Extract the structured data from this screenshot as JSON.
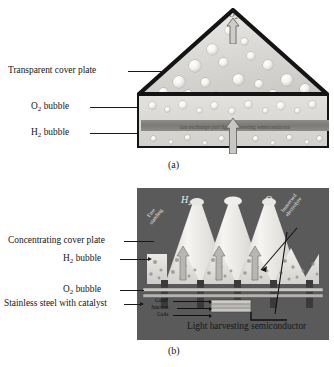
{
  "figure": {
    "panel_a": {
      "caption": "(a)",
      "labels": [
        {
          "id": "transparent-cover-plate",
          "text": "Transparent cover plate"
        },
        {
          "id": "o2-bubble",
          "text": "O",
          "sub": "2",
          "suffix": " bubble"
        },
        {
          "id": "h2-bubble",
          "text": "H",
          "sub": "2",
          "suffix": " bubble"
        }
      ],
      "band_text": "ion exchange part light harvesting semiconductor",
      "apex_gas": "O",
      "apex_gas_sub": "2"
    },
    "panel_b": {
      "caption": "(b)",
      "labels": [
        {
          "id": "concentrating-cover-plate",
          "text": "Concentrating cover plate"
        },
        {
          "id": "h2-bubble",
          "text": "H",
          "sub": "2",
          "suffix": " bubble"
        },
        {
          "id": "o2-bubble",
          "text": "O",
          "sub": "2",
          "suffix": " bubble"
        },
        {
          "id": "stainless-steel-with-catalyst",
          "text": "Stainless steel with catalyst"
        },
        {
          "id": "light-harvesting-semiconductor",
          "text": "Light harvesting semiconductor"
        }
      ],
      "gas_left": "H",
      "gas_left_sub": "2",
      "gas_right": "O",
      "gas_right_sub": "2",
      "diagonal_left": "Free\nstanding",
      "diagonal_right": "Immersed\nelectrolyte",
      "stack_labels": [
        "GaInP",
        "Junction",
        "GaAs"
      ]
    },
    "colors": {
      "panel_b_background": "#5a5a5a",
      "outline": "#141414",
      "membrane_band": "#7c7a76",
      "bubble_light": "#f4f3f1",
      "cone_light": "#efeeec",
      "electrode_dark": "#3a3a3a"
    }
  }
}
